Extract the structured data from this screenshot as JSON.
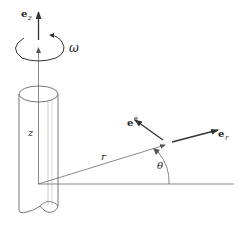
{
  "diagram": {
    "type": "cylindrical-coordinates",
    "labels": {
      "ez": "e",
      "ez_sub": "z",
      "omega": "ω",
      "z": "z",
      "r": "r",
      "theta": "θ",
      "e_theta": "e",
      "e_theta_sub": "θ",
      "e_r": "e",
      "e_r_sub": "r"
    },
    "colors": {
      "stroke": "#333333",
      "light_stroke": "#888888",
      "fill": "#ffffff"
    }
  }
}
